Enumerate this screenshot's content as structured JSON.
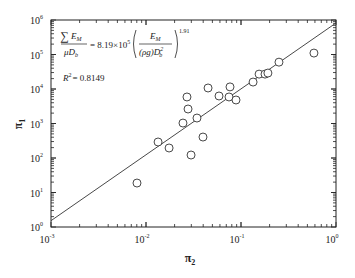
{
  "chart_data": {
    "type": "scatter",
    "title": "",
    "xlabel": "π2",
    "ylabel": "π1",
    "xscale": "log",
    "yscale": "log",
    "xlim": [
      0.001,
      1
    ],
    "ylim": [
      1,
      1000000
    ],
    "grid": false,
    "legend": null,
    "x_ticks": [
      "10^-3",
      "10^-2",
      "10^-1",
      "10^0"
    ],
    "y_ticks": [
      "10^0",
      "10^1",
      "10^2",
      "10^3",
      "10^4",
      "10^5",
      "10^6"
    ],
    "series": [
      {
        "name": "data",
        "marker": "open-circle",
        "points": [
          [
            0.00804,
            18.8
          ],
          [
            0.0134,
            291
          ],
          [
            0.0175,
            195
          ],
          [
            0.0245,
            1030
          ],
          [
            0.027,
            5870
          ],
          [
            0.0277,
            2630
          ],
          [
            0.0298,
            122
          ],
          [
            0.0344,
            1440
          ],
          [
            0.0398,
            405
          ],
          [
            0.045,
            10700
          ],
          [
            0.0587,
            6270
          ],
          [
            0.0748,
            5870
          ],
          [
            0.0766,
            11500
          ],
          [
            0.0886,
            4800
          ],
          [
            0.134,
            15900
          ],
          [
            0.155,
            27000
          ],
          [
            0.179,
            27000
          ],
          [
            0.192,
            29000
          ],
          [
            0.251,
            60000
          ],
          [
            0.586,
            110000
          ]
        ]
      },
      {
        "name": "fit",
        "type": "line",
        "equation": "π1 = 8.19e5 · π2^1.91",
        "coefficient": 819000,
        "exponent": 1.91
      }
    ],
    "annotations": {
      "equation_lhs_num": "∑E",
      "equation_lhs_num_sub": "M",
      "equation_lhs_den": "μD",
      "equation_lhs_den_sub": "b",
      "equation_rhs_coef": "= 8.19×10",
      "equation_rhs_coef_exp": "5",
      "equation_inner_num": "E",
      "equation_inner_num_sub": "M",
      "equation_inner_den": "(ρg)D",
      "equation_inner_den_sup": "2",
      "equation_inner_den_sub": "b",
      "equation_exponent": "1.91",
      "r_squared_label": "R",
      "r_squared_sup": "2",
      "r_squared_value": "= 0.8149"
    }
  }
}
